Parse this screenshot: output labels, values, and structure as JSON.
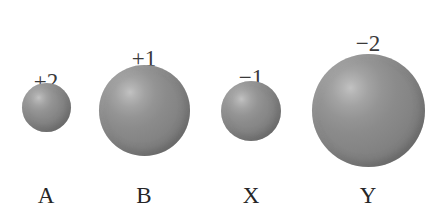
{
  "figure": {
    "background_color": "#ffffff",
    "width": 444,
    "height": 213,
    "sphere_fill_color": "#8b8b8b",
    "sphere_highlight_color": "#c2c2c2",
    "sphere_edge_color": "#686868",
    "label_color": "#262626",
    "charge_color": "#3a3a3a"
  },
  "chart_data": {
    "type": "scatter",
    "title": "",
    "xlabel": "",
    "ylabel": "",
    "categories": [
      "A",
      "B",
      "X",
      "Y"
    ],
    "series": [
      {
        "name": "relative ionic diameter (px)",
        "values": [
          49,
          91,
          60,
          113
        ]
      }
    ],
    "annotations": [
      "+2",
      "+1",
      "−1",
      "−2"
    ],
    "grid": false,
    "legend": "none"
  },
  "ions": [
    {
      "name": "A",
      "charge": "+2",
      "diameter": 49,
      "center_x": 46,
      "center_y": 107,
      "charge_x": 46,
      "charge_y": 70,
      "charge_font_size": 23,
      "label_x": 46,
      "label_y": 184,
      "label_font_size": 23
    },
    {
      "name": "B",
      "charge": "+1",
      "diameter": 91,
      "center_x": 144,
      "center_y": 110,
      "charge_x": 144,
      "charge_y": 47,
      "charge_font_size": 23,
      "label_x": 144,
      "label_y": 184,
      "label_font_size": 23
    },
    {
      "name": "X",
      "charge": "−1",
      "diameter": 60,
      "center_x": 251,
      "center_y": 111,
      "charge_x": 251,
      "charge_y": 66,
      "charge_font_size": 23,
      "label_x": 251,
      "label_y": 184,
      "label_font_size": 23
    },
    {
      "name": "Y",
      "charge": "−2",
      "diameter": 113,
      "center_x": 368,
      "center_y": 110,
      "charge_x": 368,
      "charge_y": 32,
      "charge_font_size": 23,
      "label_x": 368,
      "label_y": 184,
      "label_font_size": 23
    }
  ]
}
